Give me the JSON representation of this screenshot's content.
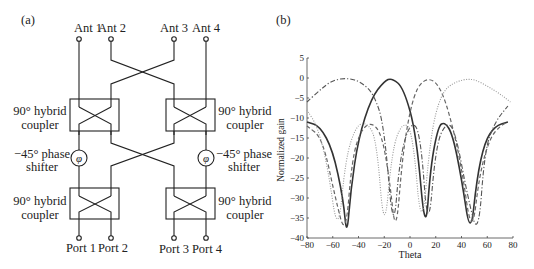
{
  "panel_a": {
    "label": "(a)",
    "antennas": [
      "Ant 1",
      "Ant 2",
      "Ant 3",
      "Ant 4"
    ],
    "ports": [
      "Port 1",
      "Port 2",
      "Port 3",
      "Port 4"
    ],
    "coupler_label_line1": "90° hybrid",
    "coupler_label_line2": "coupler",
    "phase_label_line1": "−45° phase",
    "phase_label_line2": "shifter",
    "phase_symbol": "φ"
  },
  "panel_b": {
    "label": "(b)"
  },
  "chart_data": {
    "type": "line",
    "title": "",
    "xlabel": "Theta",
    "ylabel": "Normalized gain",
    "xlim": [
      -80,
      80
    ],
    "ylim": [
      -40,
      5
    ],
    "xticks": [
      -80,
      -60,
      -40,
      -20,
      0,
      20,
      40,
      60,
      80
    ],
    "yticks": [
      5,
      0,
      -5,
      -10,
      -15,
      -20,
      -25,
      -30,
      -35,
      -40
    ],
    "grid": false,
    "legend": null,
    "series": [
      {
        "name": "beam 1 (solid dark)",
        "style": "solid",
        "color": "#333333",
        "peak_theta": -14,
        "points": [
          [
            -80,
            -11
          ],
          [
            -70,
            -12
          ],
          [
            -60,
            -18
          ],
          [
            -52,
            -30
          ],
          [
            -49,
            -40
          ],
          [
            -46,
            -28
          ],
          [
            -40,
            -15
          ],
          [
            -30,
            -5
          ],
          [
            -20,
            -0.8
          ],
          [
            -14,
            0
          ],
          [
            -5,
            -2.5
          ],
          [
            5,
            -14
          ],
          [
            12,
            -40
          ],
          [
            16,
            -22
          ],
          [
            22,
            -12
          ],
          [
            27,
            -11
          ],
          [
            33,
            -14
          ],
          [
            40,
            -25
          ],
          [
            47,
            -40
          ],
          [
            52,
            -25
          ],
          [
            58,
            -16
          ],
          [
            66,
            -12
          ],
          [
            76,
            -11
          ]
        ]
      },
      {
        "name": "beam 2 (dash-dot)",
        "style": "dashdot",
        "color": "#555555",
        "peak_theta": -48,
        "points": [
          [
            -80,
            -6
          ],
          [
            -70,
            -3
          ],
          [
            -60,
            -0.5
          ],
          [
            -48,
            0
          ],
          [
            -38,
            -1
          ],
          [
            -28,
            -4
          ],
          [
            -20,
            -12
          ],
          [
            -13,
            -40
          ],
          [
            -8,
            -20
          ],
          [
            0,
            -11
          ],
          [
            8,
            -13
          ],
          [
            14,
            -40
          ],
          [
            20,
            -17
          ],
          [
            28,
            -11
          ],
          [
            35,
            -13
          ],
          [
            45,
            -30
          ],
          [
            53,
            -40
          ],
          [
            58,
            -18
          ],
          [
            66,
            -11
          ],
          [
            76,
            -7
          ]
        ]
      },
      {
        "name": "beam 3 (dashed)",
        "style": "dashed",
        "color": "#666666",
        "peak_theta": 14,
        "points": [
          [
            -80,
            -12
          ],
          [
            -68,
            -15
          ],
          [
            -58,
            -30
          ],
          [
            -50,
            -40
          ],
          [
            -45,
            -20
          ],
          [
            -38,
            -13
          ],
          [
            -30,
            -11
          ],
          [
            -22,
            -14
          ],
          [
            -16,
            -25
          ],
          [
            -11,
            -40
          ],
          [
            -6,
            -20
          ],
          [
            0,
            -8
          ],
          [
            6,
            -2
          ],
          [
            14,
            0
          ],
          [
            22,
            -1.5
          ],
          [
            30,
            -8
          ],
          [
            40,
            -22
          ],
          [
            48,
            -40
          ],
          [
            54,
            -24
          ],
          [
            62,
            -15
          ],
          [
            70,
            -12
          ],
          [
            76,
            -11
          ]
        ]
      },
      {
        "name": "beam 4 (dotted light)",
        "style": "dotted",
        "color": "#999999",
        "peak_theta": 48,
        "points": [
          [
            -80,
            -8
          ],
          [
            -72,
            -12
          ],
          [
            -64,
            -22
          ],
          [
            -56,
            -40
          ],
          [
            -50,
            -20
          ],
          [
            -42,
            -12
          ],
          [
            -34,
            -11
          ],
          [
            -26,
            -15
          ],
          [
            -20,
            -40
          ],
          [
            -14,
            -18
          ],
          [
            -6,
            -11
          ],
          [
            2,
            -13
          ],
          [
            9,
            -40
          ],
          [
            16,
            -14
          ],
          [
            24,
            -4
          ],
          [
            34,
            -1
          ],
          [
            48,
            0
          ],
          [
            60,
            -2
          ],
          [
            70,
            -4
          ],
          [
            78,
            -6
          ]
        ]
      }
    ]
  }
}
